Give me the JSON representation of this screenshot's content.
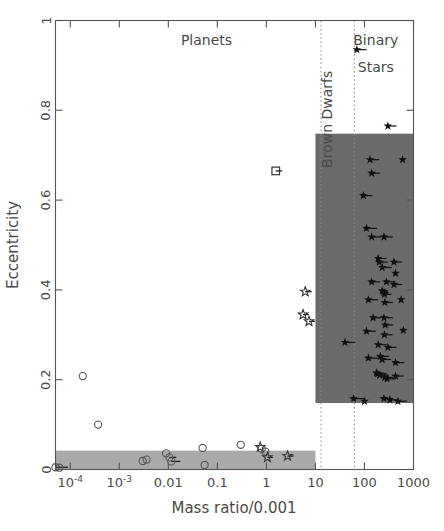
{
  "chart_data": {
    "type": "scatter",
    "title": "",
    "xlabel": "Mass ratio/0.001",
    "ylabel": "Eccentricity",
    "xscale": "log",
    "yscale": "linear",
    "xlim": [
      5e-05,
      1000
    ],
    "ylim": [
      0,
      1
    ],
    "grid": false,
    "legend": null,
    "xticks": [
      "10-4",
      "10-3",
      "0.01",
      "0.1",
      "1",
      "10",
      "100",
      "1000"
    ],
    "xtick_values": [
      0.0001,
      0.001,
      0.01,
      0.1,
      1,
      10,
      100,
      1000
    ],
    "xtick_labels": [
      {
        "mantissa": "10",
        "exponent": "-4"
      },
      {
        "mantissa": "10",
        "exponent": "-3"
      },
      {
        "mantissa": "0.01",
        "exponent": ""
      },
      {
        "mantissa": "0.1",
        "exponent": ""
      },
      {
        "mantissa": "1",
        "exponent": ""
      },
      {
        "mantissa": "10",
        "exponent": ""
      },
      {
        "mantissa": "100",
        "exponent": ""
      },
      {
        "mantissa": "1000",
        "exponent": ""
      }
    ],
    "yticks": [
      0,
      0.2,
      0.4,
      0.6,
      0.8,
      1
    ],
    "ytick_labels": [
      "0",
      "0.2",
      "0.4",
      "0.6",
      "0.8",
      "1"
    ],
    "annotations": [
      {
        "name": "planets-label",
        "text": "Planets",
        "x": 0.06,
        "y": 0.945,
        "orientation": "horizontal"
      },
      {
        "name": "brown-dwarfs-label",
        "text": "Brown Dwarfs",
        "x": 22,
        "y": 0.78,
        "orientation": "vertical"
      },
      {
        "name": "binary-stars-label-line1",
        "text": "Binary",
        "x": 170,
        "y": 0.945,
        "orientation": "horizontal"
      },
      {
        "name": "binary-stars-label-line2",
        "text": "Stars",
        "x": 170,
        "y": 0.885,
        "orientation": "horizontal"
      }
    ],
    "dividers": [
      {
        "name": "planet-browndwarf-boundary",
        "x": 13,
        "style": "dotted"
      },
      {
        "name": "browndwarf-star-boundary",
        "x": 62,
        "style": "dotted"
      }
    ],
    "shaded_regions": [
      {
        "name": "binary-star-envelope",
        "x0": 10,
        "x1": 1000,
        "y0": 0.148,
        "y1": 0.748,
        "color": "#6b6b6b"
      },
      {
        "name": "circularized-planet-band",
        "x0": 5e-05,
        "x1": 10,
        "y0": 0.0,
        "y1": 0.042,
        "color": "#aaaaaa"
      }
    ],
    "series": [
      {
        "name": "Planets",
        "marker": "open-circle",
        "points": [
          {
            "x": 5e-05,
            "y": 0.005,
            "err": 4e-05
          },
          {
            "x": 6e-05,
            "y": 0.004,
            "err": 0
          },
          {
            "x": 0.00018,
            "y": 0.208,
            "err": 0
          },
          {
            "x": 0.00037,
            "y": 0.1,
            "err": 0
          },
          {
            "x": 0.003,
            "y": 0.019,
            "err": 0
          },
          {
            "x": 0.0036,
            "y": 0.022,
            "err": 0
          },
          {
            "x": 0.009,
            "y": 0.036,
            "err": 0
          },
          {
            "x": 0.0105,
            "y": 0.027,
            "err": 0.004
          },
          {
            "x": 0.0115,
            "y": 0.018,
            "err": 0.006
          },
          {
            "x": 0.05,
            "y": 0.048,
            "err": 0
          },
          {
            "x": 0.055,
            "y": 0.01,
            "err": 0
          },
          {
            "x": 0.3,
            "y": 0.055,
            "err": 0
          },
          {
            "x": 0.8,
            "y": 0.046,
            "err": 0
          },
          {
            "x": 0.95,
            "y": 0.04,
            "err": 0
          }
        ]
      },
      {
        "name": "Brown dwarf candidates",
        "marker": "open-star",
        "points": [
          {
            "x": 0.75,
            "y": 0.05,
            "err": 0
          },
          {
            "x": 1.05,
            "y": 0.027,
            "err": 0.3
          },
          {
            "x": 2.7,
            "y": 0.03,
            "err": 0.9
          },
          {
            "x": 6.2,
            "y": 0.396,
            "err": 2.2
          },
          {
            "x": 5.6,
            "y": 0.345,
            "err": 1.7
          },
          {
            "x": 7.4,
            "y": 0.33,
            "err": 2.4
          }
        ]
      },
      {
        "name": "Transiting companion",
        "marker": "open-square",
        "points": [
          {
            "x": 1.55,
            "y": 0.665,
            "err": 0.55
          }
        ]
      },
      {
        "name": "Binary Stars",
        "marker": "filled-star",
        "points": [
          {
            "x": 70,
            "y": 0.935,
            "err": 40
          },
          {
            "x": 300,
            "y": 0.765,
            "err": 150
          },
          {
            "x": 130,
            "y": 0.69,
            "err": 70
          },
          {
            "x": 600,
            "y": 0.69,
            "err": 0
          },
          {
            "x": 140,
            "y": 0.66,
            "err": 70
          },
          {
            "x": 95,
            "y": 0.61,
            "err": 50
          },
          {
            "x": 110,
            "y": 0.537,
            "err": 70
          },
          {
            "x": 140,
            "y": 0.518,
            "err": 80
          },
          {
            "x": 250,
            "y": 0.518,
            "err": 130
          },
          {
            "x": 190,
            "y": 0.47,
            "err": 90
          },
          {
            "x": 200,
            "y": 0.462,
            "err": 100
          },
          {
            "x": 400,
            "y": 0.462,
            "err": 190
          },
          {
            "x": 230,
            "y": 0.45,
            "err": 130
          },
          {
            "x": 430,
            "y": 0.437,
            "err": 0
          },
          {
            "x": 140,
            "y": 0.418,
            "err": 70
          },
          {
            "x": 280,
            "y": 0.418,
            "err": 150
          },
          {
            "x": 400,
            "y": 0.412,
            "err": 190
          },
          {
            "x": 230,
            "y": 0.398,
            "err": 70
          },
          {
            "x": 250,
            "y": 0.394,
            "err": 60
          },
          {
            "x": 255,
            "y": 0.39,
            "err": 100
          },
          {
            "x": 120,
            "y": 0.378,
            "err": 70
          },
          {
            "x": 260,
            "y": 0.372,
            "err": 120
          },
          {
            "x": 560,
            "y": 0.378,
            "err": 0
          },
          {
            "x": 150,
            "y": 0.338,
            "err": 70
          },
          {
            "x": 250,
            "y": 0.338,
            "err": 130
          },
          {
            "x": 110,
            "y": 0.308,
            "err": 60
          },
          {
            "x": 265,
            "y": 0.322,
            "err": 120
          },
          {
            "x": 255,
            "y": 0.3,
            "err": 120
          },
          {
            "x": 620,
            "y": 0.31,
            "err": 0
          },
          {
            "x": 40,
            "y": 0.283,
            "err": 25
          },
          {
            "x": 190,
            "y": 0.278,
            "err": 90
          },
          {
            "x": 300,
            "y": 0.272,
            "err": 150
          },
          {
            "x": 120,
            "y": 0.248,
            "err": 70
          },
          {
            "x": 210,
            "y": 0.252,
            "err": 110
          },
          {
            "x": 230,
            "y": 0.245,
            "err": 120
          },
          {
            "x": 430,
            "y": 0.238,
            "err": 220
          },
          {
            "x": 175,
            "y": 0.215,
            "err": 70
          },
          {
            "x": 185,
            "y": 0.213,
            "err": 100
          },
          {
            "x": 205,
            "y": 0.21,
            "err": 110
          },
          {
            "x": 260,
            "y": 0.205,
            "err": 130
          },
          {
            "x": 290,
            "y": 0.202,
            "err": 150
          },
          {
            "x": 430,
            "y": 0.208,
            "err": 200
          },
          {
            "x": 60,
            "y": 0.158,
            "err": 40
          },
          {
            "x": 100,
            "y": 0.152,
            "err": 0
          },
          {
            "x": 250,
            "y": 0.158,
            "err": 120
          },
          {
            "x": 330,
            "y": 0.155,
            "err": 160
          },
          {
            "x": 480,
            "y": 0.152,
            "err": 250
          }
        ]
      }
    ]
  },
  "axes": {
    "x_title": "Mass ratio/0.001",
    "y_title": "Eccentricity"
  }
}
